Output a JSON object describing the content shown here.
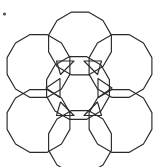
{
  "figure": {
    "type": "geometric-packing-diagram",
    "background_color": "#ffffff",
    "stroke_color": "#2a2a2a",
    "stroke_width": 1.15,
    "canvas": {
      "width": 156,
      "height": 167
    },
    "circle_count": 7,
    "triangle_count": 6,
    "polygon_sides": 12,
    "circle_radius": 32.5,
    "circles": [
      {
        "name": "center",
        "cx": 78.0,
        "cy": 88.0,
        "r": 32.5
      },
      {
        "name": "top",
        "cx": 80.0,
        "cy": 43.5,
        "r": 32.5
      },
      {
        "name": "upper-left",
        "cx": 38.5,
        "cy": 66.0,
        "r": 32.5
      },
      {
        "name": "upper-right",
        "cx": 120.5,
        "cy": 66.0,
        "r": 32.5
      },
      {
        "name": "lower-left",
        "cx": 38.5,
        "cy": 121.0,
        "r": 32.5
      },
      {
        "name": "lower-right",
        "cx": 120.5,
        "cy": 121.0,
        "r": 32.5
      },
      {
        "name": "bottom",
        "cx": 80.0,
        "cy": 142.0,
        "r": 32.5
      }
    ],
    "triangles": [
      {
        "name": "gap-upper-left",
        "points": "56.5,61.0 74.0,61.0 60.5,74.5"
      },
      {
        "name": "gap-upper-right",
        "points": "101.5,61.0 84.0,61.0 97.5,74.5"
      },
      {
        "name": "gap-left",
        "points": "46.0,88.0 60.0,78.5 60.0,97.5"
      },
      {
        "name": "gap-right",
        "points": "112.0,88.0 98.0,78.5 98.0,97.5"
      },
      {
        "name": "gap-lower-left",
        "points": "56.5,115.5 74.0,115.5 60.5,102.0"
      },
      {
        "name": "gap-lower-right",
        "points": "101.5,115.5 84.0,115.5 97.5,102.0"
      }
    ],
    "corner_mark": {
      "name": "corner-dot",
      "cx": 4.5,
      "cy": 14.0,
      "r": 1.6,
      "color": "#555555"
    }
  }
}
